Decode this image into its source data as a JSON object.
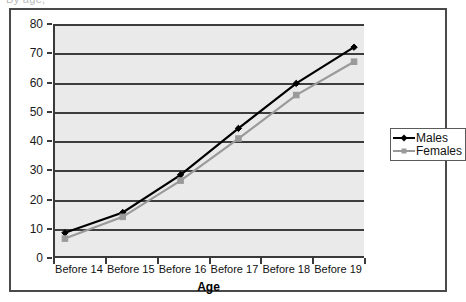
{
  "top_clipped_text": "By age,",
  "legend": {
    "position": "right",
    "entries": [
      {
        "label": "Males",
        "color": "#000000",
        "marker": "diamond"
      },
      {
        "label": "Females",
        "color": "#9a9a9a",
        "marker": "square"
      }
    ]
  },
  "axes": {
    "y_ticks": [
      "0",
      "10",
      "20",
      "30",
      "40",
      "50",
      "60",
      "70",
      "80"
    ],
    "x_title": "Age"
  },
  "chart_data": {
    "type": "line",
    "title": "",
    "xlabel": "Age",
    "ylabel": "",
    "ylim": [
      0,
      80
    ],
    "ytick_step": 10,
    "grid": true,
    "legend_position": "right",
    "categories": [
      "Before 14",
      "Before 15",
      "Before 16",
      "Before 17",
      "Before 18",
      "Before 19"
    ],
    "series": [
      {
        "name": "Males",
        "color": "#000000",
        "marker": "diamond",
        "values": [
          8,
          15,
          28,
          44,
          59.5,
          72
        ]
      },
      {
        "name": "Females",
        "color": "#9a9a9a",
        "marker": "square",
        "values": [
          6,
          13.5,
          26,
          40.5,
          55.5,
          67
        ]
      }
    ]
  }
}
